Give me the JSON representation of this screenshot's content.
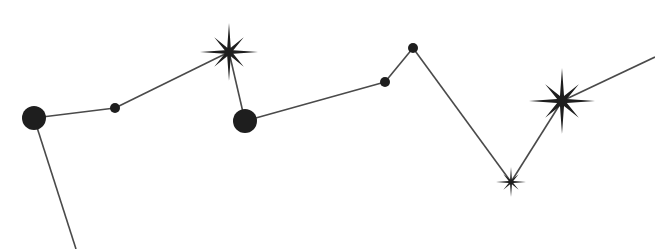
{
  "diagram": {
    "type": "constellation",
    "background": "#ffffff",
    "line_color": "#4a4a4a",
    "marker_color": "#1e1e1e",
    "nodes": [
      {
        "id": "A",
        "kind": "dot",
        "x": 34,
        "y": 118,
        "r": 12
      },
      {
        "id": "B",
        "kind": "dot",
        "x": 115,
        "y": 108,
        "r": 5
      },
      {
        "id": "C",
        "kind": "star",
        "x": 229,
        "y": 52,
        "r": 29
      },
      {
        "id": "D",
        "kind": "dot",
        "x": 245,
        "y": 121,
        "r": 12
      },
      {
        "id": "E",
        "kind": "dot",
        "x": 385,
        "y": 82,
        "r": 5
      },
      {
        "id": "F",
        "kind": "dot",
        "x": 413,
        "y": 48,
        "r": 5
      },
      {
        "id": "G",
        "kind": "star",
        "x": 511,
        "y": 182,
        "r": 15
      },
      {
        "id": "H",
        "kind": "star",
        "x": 562,
        "y": 101,
        "r": 33
      }
    ],
    "edges": [
      {
        "from": [
          34,
          118
        ],
        "to": [
          76,
          249
        ]
      },
      {
        "from": [
          34,
          118
        ],
        "to": [
          115,
          108
        ]
      },
      {
        "from": [
          115,
          108
        ],
        "to": [
          229,
          52
        ]
      },
      {
        "from": [
          229,
          52
        ],
        "to": [
          245,
          121
        ]
      },
      {
        "from": [
          245,
          121
        ],
        "to": [
          385,
          82
        ]
      },
      {
        "from": [
          385,
          82
        ],
        "to": [
          413,
          48
        ]
      },
      {
        "from": [
          413,
          48
        ],
        "to": [
          511,
          182
        ]
      },
      {
        "from": [
          511,
          182
        ],
        "to": [
          562,
          101
        ]
      },
      {
        "from": [
          562,
          101
        ],
        "to": [
          655,
          57
        ]
      }
    ]
  }
}
